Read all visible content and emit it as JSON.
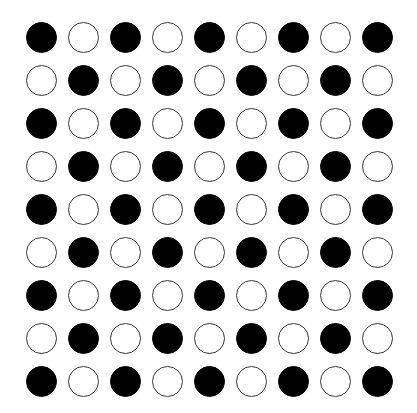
{
  "diagram": {
    "type": "dot-grid",
    "rows": 9,
    "cols": 9,
    "pattern": "checkerboard",
    "colors": {
      "filled": "#000000",
      "hollow_fill": "#ffffff",
      "hollow_stroke": "#3a3a3a",
      "background": "#ffffff"
    },
    "grid": [
      [
        1,
        0,
        1,
        0,
        1,
        0,
        1,
        0,
        1
      ],
      [
        0,
        1,
        0,
        1,
        0,
        1,
        0,
        1,
        0
      ],
      [
        1,
        0,
        1,
        0,
        1,
        0,
        1,
        0,
        1
      ],
      [
        0,
        1,
        0,
        1,
        0,
        1,
        0,
        1,
        0
      ],
      [
        1,
        0,
        1,
        0,
        1,
        0,
        1,
        0,
        1
      ],
      [
        0,
        1,
        0,
        1,
        0,
        1,
        0,
        1,
        0
      ],
      [
        1,
        0,
        1,
        0,
        1,
        0,
        1,
        0,
        1
      ],
      [
        0,
        1,
        0,
        1,
        0,
        1,
        0,
        1,
        0
      ],
      [
        1,
        0,
        1,
        0,
        1,
        0,
        1,
        0,
        1
      ]
    ]
  }
}
